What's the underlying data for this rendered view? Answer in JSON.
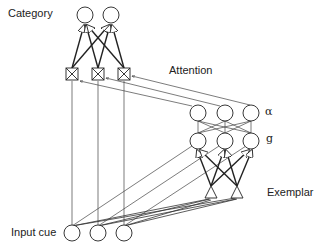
{
  "labels": {
    "category": "Category",
    "attention": "Attention",
    "alpha": "α",
    "g": "g",
    "exemplar": "Exemplar",
    "input_cue": "Input cue"
  },
  "nodes": {
    "category": [
      {
        "x": 85,
        "y": 15
      },
      {
        "x": 111,
        "y": 15
      }
    ],
    "attention_gates": [
      {
        "x": 72,
        "y": 74
      },
      {
        "x": 98,
        "y": 74
      },
      {
        "x": 124,
        "y": 74
      }
    ],
    "alpha": [
      {
        "x": 198,
        "y": 113
      },
      {
        "x": 225,
        "y": 113
      },
      {
        "x": 251,
        "y": 113
      }
    ],
    "g": [
      {
        "x": 198,
        "y": 141
      },
      {
        "x": 225,
        "y": 141
      },
      {
        "x": 251,
        "y": 141
      }
    ],
    "exemplar": [
      {
        "x": 211,
        "y": 193
      },
      {
        "x": 237,
        "y": 193
      }
    ],
    "input": [
      {
        "x": 72,
        "y": 233
      },
      {
        "x": 98,
        "y": 233
      },
      {
        "x": 124,
        "y": 233
      }
    ]
  },
  "colors": {
    "line": "#222222",
    "fill": "#ffffff"
  }
}
